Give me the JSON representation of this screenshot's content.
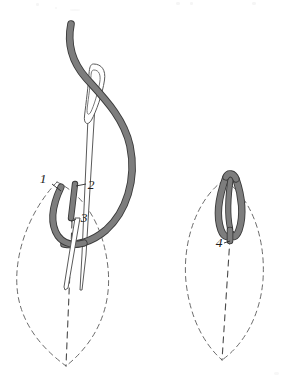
{
  "figure": {
    "canvas": {
      "width": 298,
      "height": 386,
      "background": "#ffffff"
    },
    "palette": {
      "thread_fill": "#7d7d7d",
      "thread_outline": "#3a3a3a",
      "needle_fill": "#ffffff",
      "needle_outline": "#5a5a5a",
      "guide_dash": "#6b6b6b",
      "label_color": "#1c1c1c",
      "paper": "#ffffff"
    },
    "steps": [
      {
        "id": "step-left",
        "name": "forming-the-loop",
        "caption": "",
        "labels": [
          {
            "name": "point-1",
            "text": "1",
            "x": 45,
            "y": 181,
            "meaning": "needle comes up at 1"
          },
          {
            "name": "point-2",
            "text": "2",
            "x": 89,
            "y": 187,
            "meaning": "needle goes down at 2"
          },
          {
            "name": "point-3",
            "text": "3",
            "x": 79,
            "y": 222,
            "meaning": "needle emerges at 3 over the loop"
          }
        ],
        "elements": [
          "working-thread",
          "needle",
          "thread-loop",
          "guide-petal-outline",
          "guide-center-line"
        ]
      },
      {
        "id": "step-right",
        "name": "finished-detached-chain",
        "caption": "",
        "labels": [
          {
            "name": "point-4",
            "text": "4",
            "x": 219,
            "y": 245,
            "meaning": "small anchoring stitch at 4"
          }
        ],
        "elements": [
          "completed-loop",
          "anchor-bar",
          "guide-petal-outline",
          "guide-center-line"
        ]
      }
    ],
    "labels_all": [
      "1",
      "2",
      "3",
      "4"
    ],
    "stroke_widths": {
      "thread": 1.0,
      "guide_dash": 1.0,
      "needle": 1.0
    },
    "dash_pattern": "5 4"
  }
}
